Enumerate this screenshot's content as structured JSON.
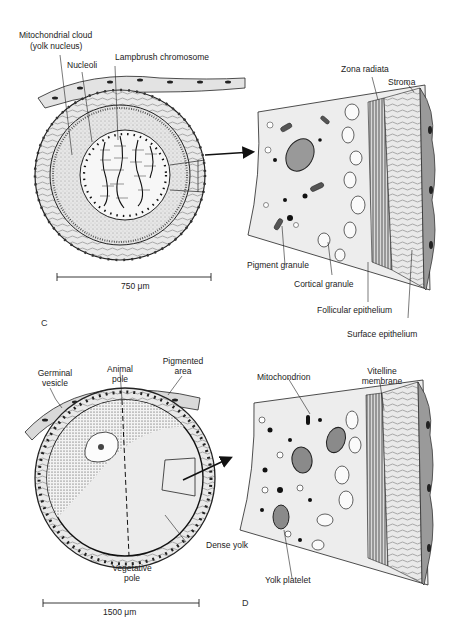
{
  "figure": {
    "panels": [
      {
        "id": "C",
        "letter": "C",
        "scale_bar": "750 μm",
        "labels": {
          "mito_cloud_1": "Mitochondrial cloud",
          "mito_cloud_2": "(yolk nucleus)",
          "nucleoli": "Nucleoli",
          "lampbrush": "Lampbrush chromosome",
          "zona_radiata": "Zona radiata",
          "stroma": "Stroma",
          "pigment_granule": "Pigment granule",
          "cortical_granule": "Cortical granule",
          "follicular_epithelium": "Follicular epithelium",
          "surface_epithelium": "Surface epithelium"
        }
      },
      {
        "id": "D",
        "letter": "D",
        "scale_bar": "1500 μm",
        "labels": {
          "germinal_vesicle_1": "Germinal",
          "germinal_vesicle_2": "vesicle",
          "animal_pole_1": "Animal",
          "animal_pole_2": "pole",
          "pigmented_area_1": "Pigmented",
          "pigmented_area_2": "area",
          "mitochondrion": "Mitochondrion",
          "vitelline_1": "Vitelline",
          "vitelline_2": "membrane",
          "dense_yolk": "Dense yolk",
          "vegetative_pole_1": "Vegetative",
          "vegetative_pole_2": "pole",
          "yolk_platelet": "Yolk platelet"
        }
      }
    ]
  },
  "colors": {
    "ink": "#1a1a1a",
    "cytoplasm": "#e4e4e4",
    "yolk": "#e8e8e8",
    "surface_epithelium": "#9a9a9a"
  }
}
